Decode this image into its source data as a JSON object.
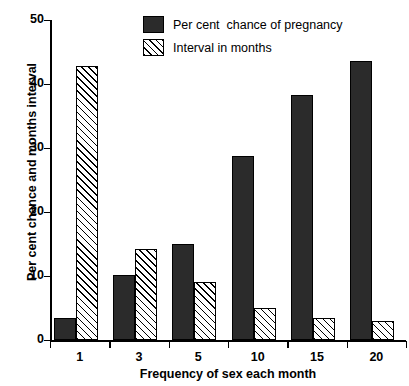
{
  "chart_data": {
    "type": "bar",
    "title": "",
    "xlabel": "Frequency of sex each month",
    "ylabel": "Per cent chance and months interval",
    "categories": [
      "1",
      "3",
      "5",
      "10",
      "15",
      "20"
    ],
    "ylim": [
      0,
      50
    ],
    "yticks": [
      0,
      10,
      20,
      30,
      40,
      50
    ],
    "grid": false,
    "legend_position": "top-right",
    "series": [
      {
        "name": "Per cent  chance of pregnancy",
        "style": "solid",
        "color": "#2b2b2b",
        "values": [
          3.4,
          10.2,
          15.0,
          28.8,
          38.3,
          43.6
        ]
      },
      {
        "name": "Interval in months",
        "style": "hatch",
        "color": "#ffffff",
        "values": [
          42.8,
          14.2,
          9.1,
          5.0,
          3.5,
          3.0
        ]
      }
    ]
  },
  "legend": {
    "items": [
      {
        "label": "Per cent  chance of pregnancy"
      },
      {
        "label": "Interval in months"
      }
    ]
  }
}
